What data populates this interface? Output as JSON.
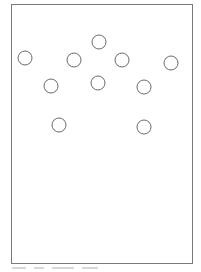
{
  "diagram": {
    "frame": {
      "x": 11,
      "y": 4,
      "width": 181,
      "height": 259,
      "stroke": "#7a7a7a"
    },
    "circle_style": {
      "radius": 7,
      "stroke": "#6a6a6a",
      "stroke_width": 1,
      "fill": "none"
    },
    "circles": [
      {
        "id": 1,
        "cx": 25,
        "cy": 58
      },
      {
        "id": 2,
        "cx": 74,
        "cy": 60
      },
      {
        "id": 3,
        "cx": 99,
        "cy": 42
      },
      {
        "id": 4,
        "cx": 122,
        "cy": 60
      },
      {
        "id": 5,
        "cx": 171,
        "cy": 63
      },
      {
        "id": 6,
        "cx": 51,
        "cy": 86
      },
      {
        "id": 7,
        "cx": 98,
        "cy": 83
      },
      {
        "id": 8,
        "cx": 144,
        "cy": 87
      },
      {
        "id": 9,
        "cx": 59,
        "cy": 125
      },
      {
        "id": 10,
        "cx": 144,
        "cy": 127
      }
    ]
  }
}
